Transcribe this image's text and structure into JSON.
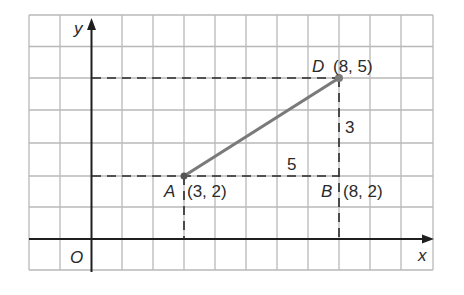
{
  "diagram": {
    "type": "coordinate-grid",
    "axes": {
      "x_label": "x",
      "y_label": "y",
      "origin_label": "O"
    },
    "points": [
      {
        "name": "A",
        "coords": "(3, 2)",
        "x": 3,
        "y": 2
      },
      {
        "name": "B",
        "coords": "(8, 2)",
        "x": 8,
        "y": 2
      },
      {
        "name": "D",
        "coords": "(8, 5)",
        "x": 8,
        "y": 5
      }
    ],
    "segments": [
      {
        "from": "A",
        "to": "D",
        "style": "solid"
      },
      {
        "from": "A",
        "to": "B",
        "style": "dashed",
        "label": "5"
      },
      {
        "from": "B",
        "to": "D",
        "style": "dashed",
        "label": "3"
      }
    ],
    "grid": {
      "x_range": [
        -2,
        11
      ],
      "y_range": [
        -1,
        7
      ]
    },
    "colors": {
      "grid": "#b5b5b5",
      "axis": "#1a1a1a",
      "segment": "#7a7a7a"
    }
  },
  "labels": {
    "x": "x",
    "y": "y",
    "o": "O",
    "a_name": "A",
    "a_coords": "(3, 2)",
    "b_name": "B",
    "b_coords": "(8, 2)",
    "d_name": "D",
    "d_coords": "(8, 5)",
    "len_ab": "5",
    "len_bd": "3"
  }
}
